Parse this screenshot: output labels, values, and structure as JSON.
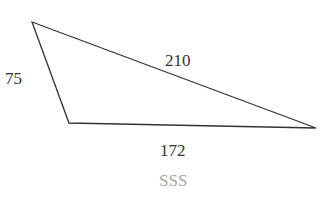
{
  "diagram": {
    "type": "triangle",
    "vertices": {
      "top_left": [
        32,
        22
      ],
      "bottom_left": [
        69,
        123
      ],
      "right": [
        316,
        128
      ]
    },
    "sides": {
      "left": "75",
      "top": "210",
      "bottom": "172"
    },
    "caption": "SSS",
    "colors": {
      "stroke": "#333333",
      "label": "#333333",
      "caption": "#a8a8a8"
    }
  }
}
